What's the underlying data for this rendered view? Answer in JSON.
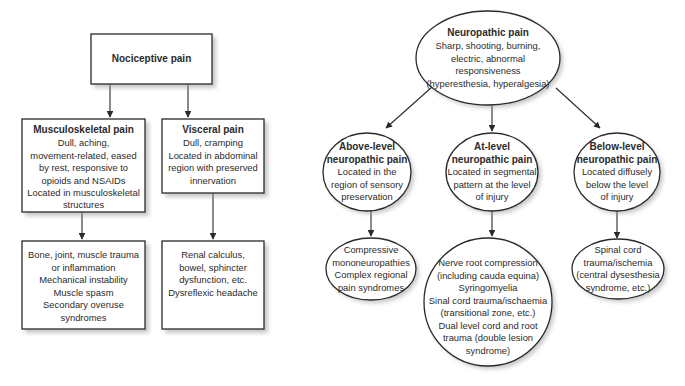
{
  "diagram": {
    "type": "flowchart",
    "colors": {
      "stroke": "#2a2a2a",
      "fill": "#ffffff",
      "text": "#2b2b2b",
      "shadow": "#9a9a9a"
    },
    "nociceptive": {
      "root": {
        "title": "Nociceptive pain",
        "lines": []
      },
      "musculoskeletal": {
        "title": "Musculoskeletal pain",
        "lines": [
          "Dull, aching,",
          "movement-related, eased",
          "by rest, responsive to",
          "opioids and NSAIDs",
          "Located in musculoskeletal",
          "structures"
        ]
      },
      "visceral": {
        "title": "Visceral pain",
        "lines": [
          "Dull, cramping",
          "Located in abdominal",
          "region with preserved",
          "innervation"
        ]
      },
      "musculoskeletal_causes": {
        "lines": [
          "Bone, joint, muscle trauma",
          "or inflammation",
          "Mechanical instability",
          "Muscle spasm",
          "Secondary overuse",
          "syndromes"
        ]
      },
      "visceral_causes": {
        "lines": [
          "Renal calculus,",
          "bowel, sphincter",
          "dysfunction, etc.",
          "Dysreflexic headache"
        ]
      }
    },
    "neuropathic": {
      "root": {
        "title": "Neuropathic pain",
        "lines": [
          "Sharp, shooting, burning,",
          "electric, abnormal",
          "responsiveness",
          "(hyperesthesia, hyperalgesia)"
        ]
      },
      "above_level": {
        "title_lines": [
          "Above-level",
          "neuropathic pain"
        ],
        "lines": [
          "Located in the",
          "region of sensory",
          "preservation"
        ]
      },
      "at_level": {
        "title_lines": [
          "At-level",
          "neuropathic pain"
        ],
        "lines": [
          "Located in segmental",
          "pattern at the level",
          "of injury"
        ]
      },
      "below_level": {
        "title_lines": [
          "Below-level",
          "neuropathic pain"
        ],
        "lines": [
          "Located diffusely",
          "below the level",
          "of injury"
        ]
      },
      "above_level_causes": {
        "lines": [
          "Compressive",
          "mononeuropathies",
          "Complex regional",
          "pain syndromes"
        ]
      },
      "at_level_causes": {
        "lines": [
          "Nerve root compression",
          "(including cauda equina)",
          "Syringomyelia",
          "Sinal cord trauma/ischaemia",
          "(transitional zone, etc.)",
          "Dual level cord and root",
          "trauma (double lesion",
          "syndrome)"
        ]
      },
      "below_level_causes": {
        "lines": [
          "Spinal cord",
          "trauma/ischemia",
          "(central dysesthesia",
          "syndrome, etc.)"
        ]
      }
    },
    "edges": [
      {
        "from": "Nociceptive pain",
        "to": "Musculoskeletal pain"
      },
      {
        "from": "Nociceptive pain",
        "to": "Visceral pain"
      },
      {
        "from": "Musculoskeletal pain",
        "to": "Musculoskeletal causes"
      },
      {
        "from": "Visceral pain",
        "to": "Visceral causes"
      },
      {
        "from": "Neuropathic pain",
        "to": "Above-level neuropathic pain"
      },
      {
        "from": "Neuropathic pain",
        "to": "At-level neuropathic pain"
      },
      {
        "from": "Neuropathic pain",
        "to": "Below-level neuropathic pain"
      },
      {
        "from": "Above-level neuropathic pain",
        "to": "Above-level causes"
      },
      {
        "from": "At-level neuropathic pain",
        "to": "At-level causes"
      },
      {
        "from": "Below-level neuropathic pain",
        "to": "Below-level causes"
      }
    ]
  }
}
